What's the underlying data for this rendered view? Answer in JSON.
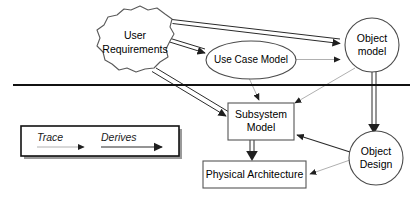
{
  "diagram": {
    "nodes": [
      {
        "id": "user-requirements",
        "label_line1": "User",
        "label_line2": "Requirements",
        "shape": "cloud"
      },
      {
        "id": "use-case-model",
        "label_line1": "Use Case Model",
        "label_line2": "",
        "shape": "ellipse"
      },
      {
        "id": "object-model",
        "label_line1": "Object",
        "label_line2": "model",
        "shape": "circle"
      },
      {
        "id": "subsystem-model",
        "label_line1": "Subsystem",
        "label_line2": "Model",
        "shape": "rect"
      },
      {
        "id": "object-design",
        "label_line1": "Object",
        "label_line2": "Design",
        "shape": "circle"
      },
      {
        "id": "physical-architecture",
        "label_line1": "Physical Architecture",
        "label_line2": "",
        "shape": "rect"
      }
    ],
    "legend": {
      "trace_label": "Trace",
      "derives_label": "Derives"
    },
    "colors": {
      "trace_arrow": "#b0b0b0",
      "derives_arrow": "#2a2a2a",
      "divider": "#111111",
      "shape_stroke": "#4a4a4a",
      "background": "#ffffff"
    },
    "edges": [
      {
        "from": "user-requirements",
        "to": "object-model",
        "kind": "derives"
      },
      {
        "from": "user-requirements",
        "to": "use-case-model",
        "kind": "derives"
      },
      {
        "from": "user-requirements",
        "to": "subsystem-model",
        "kind": "derives"
      },
      {
        "from": "use-case-model",
        "to": "object-model",
        "kind": "trace"
      },
      {
        "from": "use-case-model",
        "to": "subsystem-model",
        "kind": "trace"
      },
      {
        "from": "object-model",
        "to": "subsystem-model",
        "kind": "trace"
      },
      {
        "from": "object-model",
        "to": "object-design",
        "kind": "derives"
      },
      {
        "from": "object-design",
        "to": "subsystem-model",
        "kind": "trace-dark"
      },
      {
        "from": "object-design",
        "to": "physical-architecture",
        "kind": "trace"
      },
      {
        "from": "subsystem-model",
        "to": "physical-architecture",
        "kind": "derives"
      }
    ]
  }
}
